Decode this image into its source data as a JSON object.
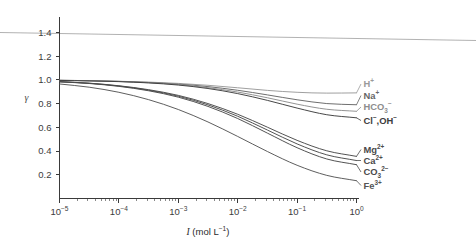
{
  "chart_data": {
    "type": "line",
    "title": "",
    "xlabel": "I (mol L⁻¹)",
    "xlabel_base": "I",
    "xlabel_unit": "(mol L",
    "xlabel_unit_exp": "−1",
    "xlabel_unit_close": ")",
    "ylabel": "γ",
    "xscale": "log",
    "xlim": [
      1e-05,
      1
    ],
    "ylim": [
      0,
      1.5
    ],
    "grid": false,
    "legend_position": "right-inline-at-curve-ends",
    "x_tick_labels": [
      "10⁻⁵",
      "10⁻⁴",
      "10⁻³",
      "10⁻²",
      "10⁻¹",
      "10⁰"
    ],
    "x_tick_mantissa": "10",
    "x_tick_exponents": [
      "−5",
      "−4",
      "−3",
      "−2",
      "−1",
      "0"
    ],
    "x_tick_values": [
      1e-05,
      0.0001,
      0.001,
      0.01,
      0.1,
      1
    ],
    "y_tick_labels": [
      "0.2",
      "0.4",
      "0.6",
      "0.8",
      "1.0",
      "1.2",
      "1.4"
    ],
    "y_tick_values": [
      0.2,
      0.4,
      0.6,
      0.8,
      1.0,
      1.2,
      1.4
    ],
    "x": [
      1e-05,
      3.16e-05,
      0.0001,
      0.000316,
      0.001,
      0.00316,
      0.01,
      0.0316,
      0.1,
      0.316,
      1.0
    ],
    "series": [
      {
        "name": "H⁺",
        "label_main": "H",
        "label_sup": "+",
        "color": "#9a9a9a",
        "values": [
          0.996,
          0.993,
          0.988,
          0.981,
          0.97,
          0.954,
          0.933,
          0.911,
          0.895,
          0.888,
          0.89
        ]
      },
      {
        "name": "Na⁺",
        "label_main": "Na",
        "label_sup": "+",
        "color": "#666666",
        "values": [
          0.996,
          0.993,
          0.987,
          0.978,
          0.964,
          0.943,
          0.912,
          0.873,
          0.832,
          0.8,
          0.79
        ]
      },
      {
        "name": "HCO₃⁻",
        "label_main": "HCO",
        "label_sub": "3",
        "label_sup": "−",
        "color": "#8d8d8d",
        "values": [
          0.996,
          0.992,
          0.986,
          0.976,
          0.96,
          0.934,
          0.897,
          0.849,
          0.795,
          0.752,
          0.735
        ]
      },
      {
        "name": "Cl⁻,OH⁻",
        "label_main": "Cl",
        "label_sup": "−",
        "label_main2": ",OH",
        "label_sup2": "−",
        "color": "#3d3d3d",
        "values": [
          0.995,
          0.991,
          0.985,
          0.974,
          0.956,
          0.927,
          0.884,
          0.827,
          0.762,
          0.706,
          0.68
        ]
      },
      {
        "name": "Mg²⁺",
        "label_main": "Mg",
        "label_sup": "2+",
        "color": "#4a4a4a",
        "values": [
          0.985,
          0.972,
          0.95,
          0.917,
          0.869,
          0.8,
          0.71,
          0.601,
          0.49,
          0.402,
          0.355
        ]
      },
      {
        "name": "Ca²⁺",
        "label_main": "Ca",
        "label_sup": "2+",
        "color": "#4a4a4a",
        "values": [
          0.984,
          0.971,
          0.948,
          0.913,
          0.862,
          0.789,
          0.693,
          0.577,
          0.46,
          0.368,
          0.32
        ]
      },
      {
        "name": "CO₃²⁻",
        "label_main": "CO",
        "label_sub": "3",
        "label_sup": "2−",
        "color": "#4a4a4a",
        "values": [
          0.983,
          0.969,
          0.945,
          0.908,
          0.854,
          0.776,
          0.674,
          0.551,
          0.428,
          0.333,
          0.285
        ]
      },
      {
        "name": "Fe³⁺",
        "label_main": "Fe",
        "label_sup": "3+",
        "color": "#555555",
        "values": [
          0.965,
          0.938,
          0.895,
          0.833,
          0.75,
          0.645,
          0.523,
          0.396,
          0.28,
          0.195,
          0.15
        ]
      }
    ]
  }
}
